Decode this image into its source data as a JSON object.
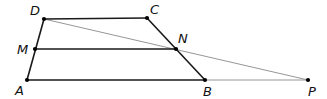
{
  "diagram": {
    "type": "geometry-trapezoid",
    "points": {
      "D": {
        "label": "D",
        "x": 44,
        "y": 19,
        "lx": 30,
        "ly": 15
      },
      "C": {
        "label": "C",
        "x": 147,
        "y": 18,
        "lx": 150,
        "ly": 14
      },
      "M": {
        "label": "M",
        "x": 35,
        "y": 49,
        "lx": 17,
        "ly": 54
      },
      "N": {
        "label": "N",
        "x": 176,
        "y": 49,
        "lx": 178,
        "ly": 43
      },
      "A": {
        "label": "A",
        "x": 27,
        "y": 80,
        "lx": 15,
        "ly": 95
      },
      "B": {
        "label": "B",
        "x": 205,
        "y": 80,
        "lx": 203,
        "ly": 96
      },
      "P": {
        "label": "P",
        "x": 308,
        "y": 80,
        "lx": 308,
        "ly": 96
      }
    },
    "segments": [
      {
        "from": "D",
        "to": "C",
        "style": "thick"
      },
      {
        "from": "C",
        "to": "B",
        "style": "thick"
      },
      {
        "from": "D",
        "to": "A",
        "style": "thick"
      },
      {
        "from": "M",
        "to": "N",
        "style": "thick"
      },
      {
        "from": "A",
        "to": "B",
        "style": "thick"
      },
      {
        "from": "B",
        "to": "P",
        "style": "thin"
      },
      {
        "from": "D",
        "to": "P",
        "style": "thin"
      }
    ],
    "colors": {
      "thick": "#1a1a1a",
      "thin": "#8a8a8a",
      "point": "#000000"
    }
  }
}
